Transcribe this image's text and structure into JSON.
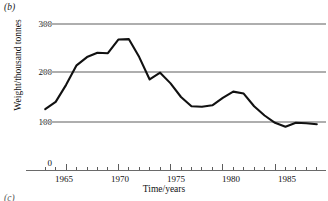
{
  "figure": {
    "panel_label": "(b)",
    "next_panel_label": "(c)"
  },
  "axes": {
    "y_title": "Weight/thousand tonnes",
    "x_title": "Time/years",
    "y_ticks": [
      "0",
      "100",
      "200",
      "300"
    ],
    "x_ticks": [
      "1965",
      "1970",
      "1975",
      "1980",
      "1985"
    ]
  },
  "colors": {
    "line": "#111111",
    "grid": "#aeaeae",
    "axis": "#6a6a6a",
    "background": "#ffffff"
  },
  "chart_data": {
    "type": "line",
    "title": "(b)",
    "xlabel": "Time/years",
    "ylabel": "Weight/thousand tonnes",
    "xlim": [
      1962.5,
      1989.5
    ],
    "ylim": [
      0,
      310
    ],
    "grid": true,
    "gridlines_y": [
      100,
      200,
      300
    ],
    "legend": null,
    "x": [
      1963,
      1964,
      1965,
      1966,
      1967,
      1968,
      1969,
      1970,
      1971,
      1972,
      1973,
      1974,
      1975,
      1976,
      1977,
      1978,
      1979,
      1980,
      1981,
      1982,
      1983,
      1984,
      1985,
      1986,
      1987,
      1988,
      1989
    ],
    "series": [
      {
        "name": "Weight",
        "values": [
          125,
          140,
          175,
          215,
          232,
          241,
          240,
          268,
          269,
          232,
          186,
          200,
          178,
          150,
          131,
          130,
          133,
          148,
          161,
          157,
          131,
          112,
          97,
          89,
          97,
          96,
          94
        ]
      }
    ],
    "x_tick_values": [
      1965,
      1970,
      1975,
      1980,
      1985
    ],
    "y_tick_values": [
      0,
      100,
      200,
      300
    ],
    "minor_x_tick_interval": 1
  }
}
